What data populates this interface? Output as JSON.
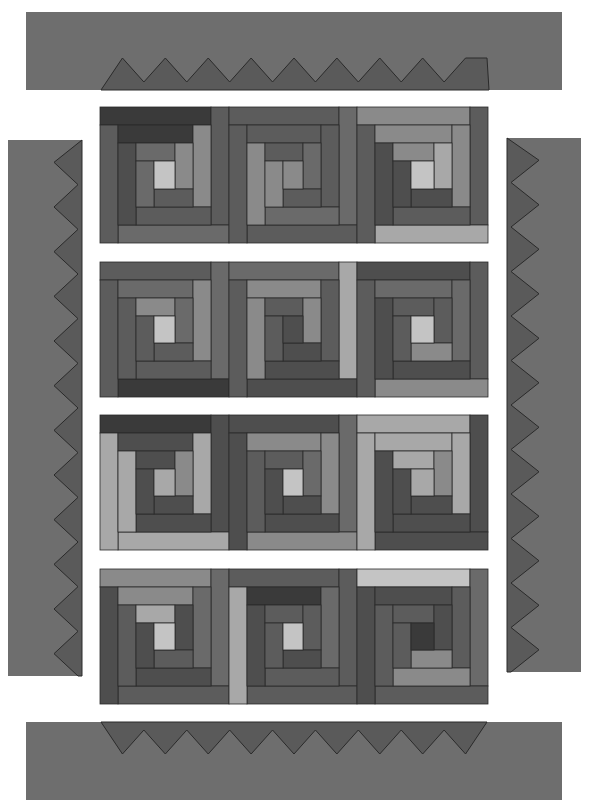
{
  "diagram": {
    "type": "quilt-layout",
    "pattern": "log-cabin",
    "rows": 4,
    "blocks_per_row": 3,
    "background": "#ffffff",
    "stroke": "#2a2a2a"
  },
  "palette": {
    "D": "#3a3a3a",
    "d": "#4e4e4e",
    "m": "#5c5c5c",
    "M": "#6a6a6a",
    "l": "#8a8a8a",
    "L": "#a8a8a8",
    "W": "#c4c4c4",
    "border_bg": "#6e6e6e",
    "border_teeth": "#5a5a5a"
  },
  "borders": {
    "top": {
      "x": 26,
      "y": 12,
      "w": 536,
      "h": 78,
      "teeth_count": 9,
      "teeth_side": "bottom"
    },
    "bottom": {
      "x": 26,
      "y": 722,
      "w": 536,
      "h": 78,
      "teeth_count": 9,
      "teeth_side": "top"
    },
    "left": {
      "x": 8,
      "y": 140,
      "w": 74,
      "h": 536,
      "teeth_count": 12,
      "teeth_side": "right"
    },
    "right": {
      "x": 507,
      "y": 138,
      "w": 74,
      "h": 534,
      "teeth_count": 12,
      "teeth_side": "left"
    }
  },
  "quilt_rows": [
    {
      "y": 107,
      "h": 136,
      "blocks": [
        {
          "x": 100,
          "w": 129,
          "colors": [
            "W",
            "D",
            "l",
            "m",
            "d",
            "M",
            "l",
            "m",
            "M",
            "D",
            "M",
            "l",
            "M"
          ],
          "frame": [
            "D",
            "m",
            "M",
            "m"
          ]
        },
        {
          "x": 229,
          "w": 128,
          "colors": [
            "l",
            "m",
            "m",
            "M",
            "l",
            "m",
            "M",
            "m",
            "l",
            "m",
            "M",
            "l",
            "d"
          ],
          "frame": [
            "m",
            "M",
            "m",
            "m"
          ]
        },
        {
          "x": 357,
          "w": 131,
          "colors": [
            "W",
            "l",
            "l",
            "m",
            "d",
            "l",
            "L",
            "d",
            "d",
            "L",
            "d",
            "L",
            "m"
          ],
          "frame": [
            "l",
            "m",
            "L",
            "m"
          ]
        }
      ]
    },
    {
      "y": 262,
      "h": 135,
      "blocks": [
        {
          "x": 100,
          "w": 129,
          "colors": [
            "W",
            "M",
            "l",
            "m",
            "m",
            "l",
            "M",
            "m",
            "m",
            "M",
            "m",
            "d",
            "M"
          ],
          "frame": [
            "m",
            "M",
            "D",
            "m"
          ]
        },
        {
          "x": 229,
          "w": 128,
          "colors": [
            "d",
            "l",
            "m",
            "d",
            "l",
            "m",
            "l",
            "d",
            "m",
            "l",
            "m",
            "l",
            "m"
          ],
          "frame": [
            "M",
            "L",
            "d",
            "m"
          ]
        },
        {
          "x": 357,
          "w": 131,
          "colors": [
            "W",
            "M",
            "M",
            "d",
            "d",
            "m",
            "m",
            "l",
            "m",
            "M",
            "l",
            "m",
            "l"
          ],
          "frame": [
            "d",
            "m",
            "l",
            "m"
          ]
        }
      ]
    },
    {
      "y": 415,
      "h": 135,
      "blocks": [
        {
          "x": 100,
          "w": 129,
          "colors": [
            "L",
            "d",
            "L",
            "d",
            "L",
            "d",
            "l",
            "d",
            "d",
            "L",
            "d",
            "L",
            "d"
          ],
          "frame": [
            "D",
            "d",
            "L",
            "L"
          ]
        },
        {
          "x": 229,
          "w": 128,
          "colors": [
            "W",
            "l",
            "l",
            "d",
            "m",
            "m",
            "M",
            "d",
            "d",
            "l",
            "d",
            "m",
            "d"
          ],
          "frame": [
            "d",
            "M",
            "l",
            "d"
          ]
        },
        {
          "x": 357,
          "w": 131,
          "colors": [
            "L",
            "L",
            "L",
            "d",
            "d",
            "L",
            "l",
            "d",
            "d",
            "L",
            "d",
            "l",
            "d"
          ],
          "frame": [
            "L",
            "d",
            "d",
            "L"
          ]
        }
      ]
    },
    {
      "y": 569,
      "h": 135,
      "blocks": [
        {
          "x": 100,
          "w": 129,
          "colors": [
            "W",
            "l",
            "M",
            "d",
            "m",
            "L",
            "d",
            "m",
            "d",
            "d",
            "m",
            "M",
            "d"
          ],
          "frame": [
            "l",
            "M",
            "m",
            "d"
          ]
        },
        {
          "x": 229,
          "w": 128,
          "colors": [
            "W",
            "D",
            "M",
            "m",
            "d",
            "m",
            "m",
            "d",
            "m",
            "m",
            "d",
            "l",
            "m"
          ],
          "frame": [
            "m",
            "m",
            "m",
            "L"
          ]
        },
        {
          "x": 357,
          "w": 131,
          "colors": [
            "D",
            "d",
            "m",
            "l",
            "m",
            "m",
            "d",
            "l",
            "m",
            "m",
            "l",
            "m",
            "l"
          ],
          "frame": [
            "W",
            "M",
            "m",
            "d"
          ]
        }
      ]
    }
  ]
}
